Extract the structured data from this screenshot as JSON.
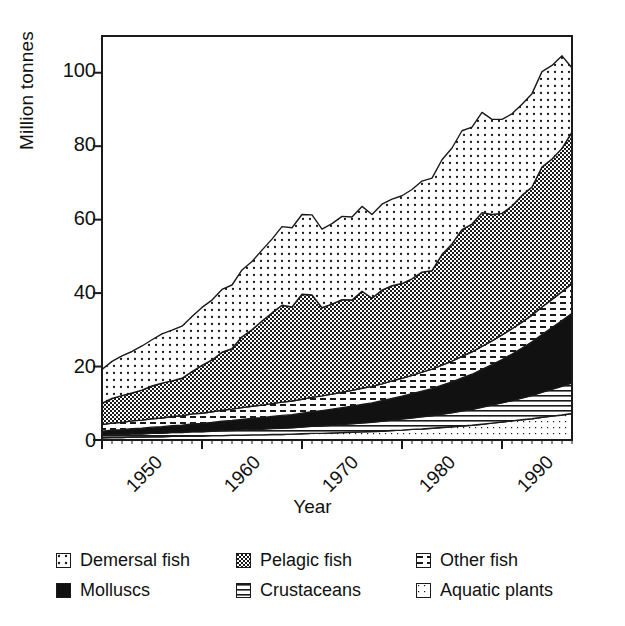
{
  "chart_data": {
    "type": "area",
    "stacked": true,
    "title": "",
    "xlabel": "Year",
    "ylabel": "Million tonnes",
    "xlim": [
      1950,
      1997
    ],
    "ylim": [
      0,
      110
    ],
    "yticks": [
      0,
      20,
      40,
      60,
      80,
      100
    ],
    "xticks": [
      1950,
      1960,
      1970,
      1980,
      1990
    ],
    "xtick_rotation": -45,
    "grid": false,
    "legend_position": "below",
    "legend_columns": 3,
    "x": [
      1950,
      1951,
      1952,
      1953,
      1954,
      1955,
      1956,
      1957,
      1958,
      1959,
      1960,
      1961,
      1962,
      1963,
      1964,
      1965,
      1966,
      1967,
      1968,
      1969,
      1970,
      1971,
      1972,
      1973,
      1974,
      1975,
      1976,
      1977,
      1978,
      1979,
      1980,
      1981,
      1982,
      1983,
      1984,
      1985,
      1986,
      1987,
      1988,
      1989,
      1990,
      1991,
      1992,
      1993,
      1994,
      1995,
      1996,
      1997
    ],
    "stack_order_bottom_to_top": [
      "Aquatic plants",
      "Crustaceans",
      "Molluscs",
      "Other fish",
      "Pelagic fish",
      "Demersal fish"
    ],
    "series": [
      {
        "name": "Aquatic plants",
        "pattern": "light-dots",
        "color": "#ffffff",
        "values": [
          0.6,
          0.7,
          0.7,
          0.8,
          0.8,
          0.9,
          0.9,
          1.0,
          1.0,
          1.1,
          1.1,
          1.2,
          1.2,
          1.3,
          1.3,
          1.4,
          1.4,
          1.5,
          1.5,
          1.6,
          1.7,
          1.8,
          1.8,
          1.9,
          2.0,
          2.1,
          2.2,
          2.3,
          2.4,
          2.6,
          2.7,
          2.9,
          3.0,
          3.2,
          3.4,
          3.6,
          3.8,
          4.0,
          4.3,
          4.6,
          4.9,
          5.2,
          5.5,
          5.8,
          6.2,
          6.5,
          6.8,
          7.2
        ]
      },
      {
        "name": "Crustaceans",
        "pattern": "horizontal-lines",
        "color": "#ffffff",
        "values": [
          0.6,
          0.7,
          0.7,
          0.8,
          0.8,
          0.9,
          0.9,
          1.0,
          1.0,
          1.1,
          1.1,
          1.2,
          1.3,
          1.3,
          1.4,
          1.5,
          1.5,
          1.6,
          1.7,
          1.7,
          1.8,
          1.9,
          2.0,
          2.1,
          2.2,
          2.3,
          2.4,
          2.5,
          2.7,
          2.8,
          3.0,
          3.1,
          3.3,
          3.4,
          3.6,
          3.8,
          4.1,
          4.3,
          4.6,
          4.9,
          5.2,
          5.5,
          5.9,
          6.3,
          6.8,
          7.3,
          7.8,
          8.3
        ]
      },
      {
        "name": "Molluscs",
        "pattern": "solid-black",
        "color": "#111111",
        "values": [
          1.2,
          1.3,
          1.4,
          1.5,
          1.6,
          1.7,
          1.8,
          1.9,
          2.0,
          2.2,
          2.3,
          2.4,
          2.6,
          2.7,
          2.9,
          3.0,
          3.2,
          3.3,
          3.5,
          3.6,
          3.8,
          4.0,
          4.2,
          4.4,
          4.6,
          4.8,
          5.1,
          5.3,
          5.6,
          5.9,
          6.2,
          6.6,
          7.0,
          7.4,
          7.9,
          8.4,
          9.0,
          9.6,
          10.3,
          11.0,
          11.8,
          12.7,
          13.6,
          14.6,
          15.7,
          16.8,
          17.9,
          19.0
        ]
      },
      {
        "name": "Other fish",
        "pattern": "dashes",
        "color": "#ffffff",
        "values": [
          1.8,
          1.9,
          2.0,
          2.1,
          2.2,
          2.3,
          2.4,
          2.5,
          2.6,
          2.7,
          2.8,
          2.9,
          3.0,
          3.1,
          3.2,
          3.3,
          3.4,
          3.5,
          3.6,
          3.7,
          3.8,
          3.9,
          4.0,
          4.1,
          4.2,
          4.3,
          4.4,
          4.5,
          4.6,
          4.8,
          4.9,
          5.0,
          5.2,
          5.3,
          5.5,
          5.7,
          5.9,
          6.1,
          6.3,
          6.5,
          6.7,
          6.9,
          7.1,
          7.3,
          7.5,
          7.7,
          7.9,
          8.1
        ]
      },
      {
        "name": "Pelagic fish",
        "pattern": "dense-checker",
        "color": "#808080",
        "values": [
          5.8,
          6.7,
          7.3,
          7.6,
          8.2,
          8.9,
          9.5,
          9.7,
          10.2,
          11.5,
          13.0,
          14.1,
          15.8,
          16.5,
          19.3,
          20.8,
          22.9,
          24.7,
          26.4,
          25.6,
          28.6,
          27.9,
          24.0,
          24.5,
          25.2,
          24.6,
          26.4,
          24.0,
          25.5,
          25.9,
          25.8,
          26.3,
          27.2,
          26.8,
          30.1,
          31.9,
          34.5,
          34.8,
          36.4,
          34.4,
          33.1,
          33.4,
          34.5,
          34.9,
          38.1,
          38.2,
          39.0,
          41.2
        ]
      },
      {
        "name": "Demersal fish",
        "pattern": "sparse-dots",
        "color": "#ffffff",
        "values": [
          9.2,
          10.1,
          10.8,
          11.3,
          12.0,
          12.6,
          13.4,
          13.8,
          14.2,
          15.0,
          15.8,
          16.3,
          17.1,
          17.3,
          18.2,
          18.6,
          19.3,
          20.1,
          21.4,
          21.6,
          21.7,
          21.8,
          21.4,
          21.9,
          22.7,
          22.6,
          23.1,
          22.8,
          23.4,
          23.6,
          23.9,
          24.3,
          24.8,
          25.2,
          25.8,
          26.1,
          26.9,
          26.4,
          27.3,
          25.9,
          25.6,
          25.1,
          24.8,
          25.4,
          26.0,
          25.5,
          25.2,
          17.5
        ]
      }
    ],
    "series_totals": [
      19.2,
      21.4,
      22.9,
      24.1,
      25.6,
      27.3,
      28.9,
      29.9,
      31.0,
      33.6,
      36.1,
      38.1,
      41.0,
      42.2,
      46.3,
      48.6,
      52.7,
      55.7,
      59.1,
      58.8,
      62.4,
      61.3,
      57.4,
      58.9,
      60.9,
      60.7,
      63.6,
      61.4,
      64.2,
      65.6,
      66.5,
      68.2,
      70.5,
      71.3,
      76.3,
      79.5,
      84.2,
      85.2,
      89.2,
      87.3,
      87.3,
      88.8,
      91.4,
      94.3,
      100.3,
      102.0,
      103.6,
      101.3
    ]
  },
  "axis": {
    "ylabel": "Million tonnes",
    "xlabel": "Year",
    "ytick_labels": [
      "100",
      "80",
      "60",
      "40",
      "20",
      "0"
    ],
    "xtick_labels": [
      "1950",
      "1960",
      "1970",
      "1980",
      "1990"
    ]
  },
  "legend": {
    "rows": [
      [
        {
          "label": "Demersal fish",
          "swatch": "sparse-dots-swatch"
        },
        {
          "label": "Pelagic fish",
          "swatch": "dense-checker-swatch"
        },
        {
          "label": "Other fish",
          "swatch": "dashes-swatch"
        }
      ],
      [
        {
          "label": "Molluscs",
          "swatch": "solid-black-swatch"
        },
        {
          "label": "Crustaceans",
          "swatch": "horizontal-lines-swatch"
        },
        {
          "label": "Aquatic plants",
          "swatch": "light-dots-swatch"
        }
      ]
    ]
  }
}
